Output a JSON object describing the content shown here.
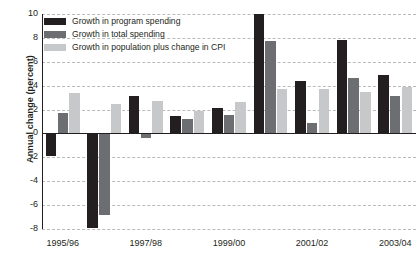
{
  "chart_data": {
    "type": "bar",
    "title": "",
    "subtitle": "",
    "xlabel": "",
    "ylabel": "Annual change (percent)",
    "ylim": [
      -8,
      10
    ],
    "ytick_step": 2,
    "yticks": [
      10,
      8,
      6,
      4,
      2,
      0,
      -2,
      -4,
      -6,
      -8
    ],
    "ytick_labels": [
      "10",
      "8",
      "6",
      "4",
      "2",
      "0",
      "-2",
      "-4",
      "-6",
      "-8"
    ],
    "grid": true,
    "grid_style": "dashed horizontal",
    "legend_position": "top-left inside",
    "categories": [
      "1995/96",
      "1996/97",
      "1997/98",
      "1998/99",
      "1999/00",
      "2000/01",
      "2001/02",
      "2002/03",
      "2003/04"
    ],
    "xtick_labels_shown": [
      "1995/96",
      "1997/98",
      "1999/00",
      "2001/02",
      "2003/04"
    ],
    "series": [
      {
        "name": "Growth in program spending",
        "color": "#231f20",
        "values": [
          -1.9,
          -7.9,
          3.15,
          1.45,
          2.15,
          10.0,
          4.4,
          7.8,
          4.9
        ]
      },
      {
        "name": "Growth in total spending",
        "color": "#6d6e71",
        "values": [
          1.7,
          -6.8,
          -0.4,
          1.2,
          1.55,
          7.7,
          0.85,
          4.65,
          3.1
        ]
      },
      {
        "name": "Growth in population plus change in CPI",
        "color": "#c7c8ca",
        "values": [
          3.35,
          2.5,
          2.75,
          1.85,
          2.65,
          3.7,
          3.7,
          3.5,
          3.85
        ]
      }
    ]
  },
  "legend": {
    "items": [
      {
        "label": "Growth in program spending",
        "color": "#231f20"
      },
      {
        "label": "Growth in total spending",
        "color": "#6d6e71"
      },
      {
        "label": "Growth in population plus change in CPI",
        "color": "#c7c8ca"
      }
    ]
  }
}
